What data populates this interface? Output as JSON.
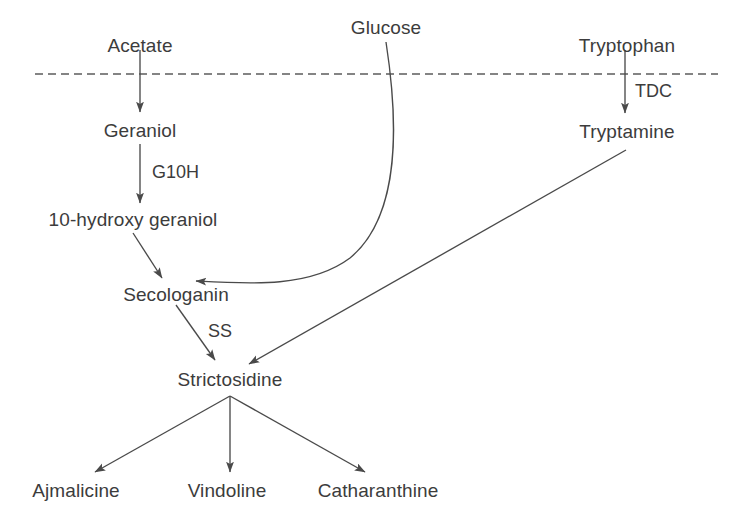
{
  "diagram": {
    "type": "biosynthetic-pathway-flowchart",
    "background_color": "#ffffff",
    "stroke_color": "#4a4a4a",
    "text_color": "#3c3c3c",
    "membrane_line": {
      "style": "dashed",
      "label": "",
      "y": 74,
      "x_start": 35,
      "x_end": 718
    },
    "nodes": {
      "acetate": "Acetate",
      "glucose": "Glucose",
      "tryptophan": "Tryptophan",
      "geraniol": "Geraniol",
      "tryptamine": "Tryptamine",
      "hydroxy_geraniol": "10-hydroxy geraniol",
      "secologanin": "Secologanin",
      "strictosidine": "Strictosidine",
      "ajmalicine": "Ajmalicine",
      "vindoline": "Vindoline",
      "catharanthine": "Catharanthine"
    },
    "enzymes": {
      "g10h": "G10H",
      "tdc": "TDC",
      "ss": "SS"
    },
    "edges": [
      {
        "from": "Acetate",
        "to": "Geraniol",
        "enzyme": "",
        "shape": "straight-vertical"
      },
      {
        "from": "Geraniol",
        "to": "10-hydroxy geraniol",
        "enzyme": "G10H",
        "shape": "straight-vertical"
      },
      {
        "from": "Tryptophan",
        "to": "Tryptamine",
        "enzyme": "TDC",
        "shape": "straight-vertical"
      },
      {
        "from": "10-hydroxy geraniol",
        "to": "Secologanin",
        "enzyme": "",
        "shape": "diagonal"
      },
      {
        "from": "Glucose",
        "to": "Secologanin",
        "enzyme": "",
        "shape": "curved"
      },
      {
        "from": "Secologanin",
        "to": "Strictosidine",
        "enzyme": "SS",
        "shape": "diagonal"
      },
      {
        "from": "Tryptamine",
        "to": "Strictosidine",
        "enzyme": "",
        "shape": "diagonal"
      },
      {
        "from": "Strictosidine",
        "to": "Ajmalicine",
        "enzyme": "",
        "shape": "diagonal"
      },
      {
        "from": "Strictosidine",
        "to": "Vindoline",
        "enzyme": "",
        "shape": "straight-vertical"
      },
      {
        "from": "Strictosidine",
        "to": "Catharanthine",
        "enzyme": "",
        "shape": "diagonal"
      }
    ]
  }
}
